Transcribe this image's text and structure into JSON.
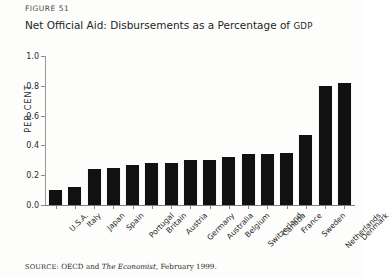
{
  "figure": {
    "number_label": "FIGURE 51",
    "title_main": "Net Official Aid: Disbursements as a Percentage of ",
    "title_smallcaps": "GDP",
    "source_lead": "SOURCE:",
    "source_body_a": " OECD and ",
    "source_italic": "The Economist",
    "source_body_b": ", February 1999."
  },
  "chart_data": {
    "type": "bar",
    "title": "Net Official Aid: Disbursements as a Percentage of GDP",
    "xlabel": "",
    "ylabel": "PER CENT",
    "ylim": [
      0.0,
      1.0
    ],
    "yticks": [
      "0.0",
      "0.2",
      "0.4",
      "0.6",
      "0.8",
      "1.0"
    ],
    "ytick_values": [
      0.0,
      0.2,
      0.4,
      0.6,
      0.8,
      1.0
    ],
    "grid": false,
    "legend": "none",
    "bar_color": "#111111",
    "categories": [
      "U.S.A.",
      "Italy",
      "Japan",
      "Spain",
      "Portugal",
      "Britain",
      "Austria",
      "Germany",
      "Australia",
      "Belgium",
      "Switzerland",
      "Canada",
      "France",
      "Sweden",
      "Netherlands",
      "Denmark"
    ],
    "values": [
      0.1,
      0.12,
      0.24,
      0.25,
      0.27,
      0.28,
      0.28,
      0.3,
      0.3,
      0.32,
      0.34,
      0.34,
      0.35,
      0.47,
      0.8,
      0.82
    ]
  }
}
